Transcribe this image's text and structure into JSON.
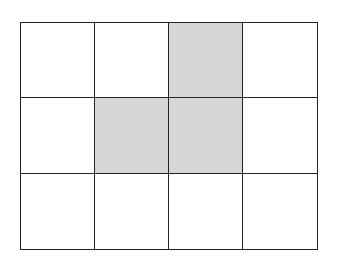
{
  "diagram": {
    "type": "grid",
    "rows": 3,
    "cols": 4,
    "colors": {
      "shaded": "#d6d6d6",
      "empty": "#ffffff",
      "line": "#222222"
    },
    "cells": [
      [
        false,
        false,
        true,
        false
      ],
      [
        false,
        true,
        true,
        false
      ],
      [
        false,
        false,
        false,
        false
      ]
    ]
  }
}
